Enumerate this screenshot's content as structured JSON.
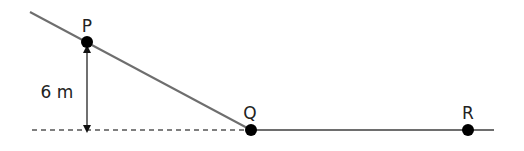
{
  "diagram": {
    "colors": {
      "line": "#6e6e6e",
      "point": "#000000",
      "text": "#222222"
    },
    "points": [
      {
        "id": "P",
        "label": "P",
        "x": 87,
        "y": 42,
        "label_x": 87,
        "label_y": 27
      },
      {
        "id": "Q",
        "label": "Q",
        "x": 251,
        "y": 130,
        "label_x": 250,
        "label_y": 114
      },
      {
        "id": "R",
        "label": "R",
        "x": 468,
        "y": 130,
        "label_x": 468,
        "label_y": 114
      }
    ],
    "slope_line": {
      "x1": 30,
      "y1": 12,
      "x2": 251,
      "y2": 130
    },
    "ground_line": {
      "x1": 251,
      "y1": 130,
      "x2": 494,
      "y2": 130
    },
    "reference_dashed_line": {
      "x1": 32,
      "y1": 130,
      "x2": 247,
      "y2": 130
    },
    "height_dimension": {
      "x": 87,
      "y_top": 49,
      "y_bottom": 129,
      "label": "6 m",
      "label_x": 57,
      "label_y": 93
    }
  }
}
